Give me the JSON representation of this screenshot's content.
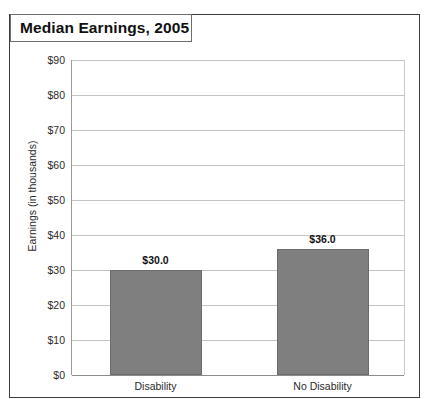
{
  "chart_data": {
    "type": "bar",
    "title": "Median Earnings, 2005",
    "xlabel": "",
    "ylabel": "Earnings (in thousands)",
    "categories": [
      "Disability",
      "No Disability"
    ],
    "values": [
      30.0,
      36.0
    ],
    "value_labels": [
      "$30.0",
      "$36.0"
    ],
    "ylim": [
      0,
      90
    ],
    "ytick_values": [
      0,
      10,
      20,
      30,
      40,
      50,
      60,
      70,
      80,
      90
    ],
    "ytick_labels": [
      "$0",
      "$10",
      "$20",
      "$30",
      "$40",
      "$50",
      "$60",
      "$70",
      "$80",
      "$90"
    ],
    "grid": true,
    "legend": "none",
    "bar_color": "#7f7f7f",
    "gridline_color": "#c4c4c4",
    "frame_color": "#3c3c3c"
  },
  "footer": {
    "clipped_note": ""
  }
}
